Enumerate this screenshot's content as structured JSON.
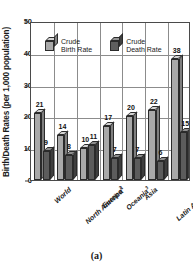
{
  "chart_data": {
    "type": "bar",
    "title": "",
    "xlabel": "",
    "ylabel": "Birth/Death Rates (per 1,000 population)",
    "ylim": [
      0,
      50
    ],
    "yticks": [
      0,
      10,
      20,
      30,
      40,
      50
    ],
    "grid": true,
    "legend_position": "top-left-inside",
    "categories": [
      "World",
      "North America",
      "Europe",
      "Oceania",
      "Asia",
      "Latin America and the Caribbean",
      "Africa"
    ],
    "category_footnotes": [
      "",
      "1",
      "2",
      "3",
      "",
      "",
      ""
    ],
    "series": [
      {
        "name": "Crude Birth Rate",
        "values": [
          21,
          14,
          10,
          17,
          20,
          22,
          38
        ],
        "color": "#a9a9a9"
      },
      {
        "name": "Crude Death Rate",
        "values": [
          9,
          8,
          11,
          7,
          7,
          6,
          15
        ],
        "color": "#5c5c5c"
      }
    ]
  },
  "axis": {
    "y_title": "Birth/Death Rates (per 1,000 population)",
    "y_ticks": [
      "0",
      "10",
      "20",
      "30",
      "40",
      "50"
    ]
  },
  "legend": {
    "items": [
      {
        "label_line1": "Crude",
        "label_line2": "Birth Rate",
        "swatch": "cube-light-icon"
      },
      {
        "label_line1": "Crude",
        "label_line2": "Death Rate",
        "swatch": "cube-dark-icon"
      }
    ]
  },
  "xlabels": [
    {
      "text": "World",
      "note": ""
    },
    {
      "text": "North America",
      "note": "1"
    },
    {
      "text": "Europe",
      "note": "2"
    },
    {
      "text": "Oceania",
      "note": "3"
    },
    {
      "text": "Asia",
      "note": ""
    },
    {
      "text": "Latin America",
      "note": ""
    },
    {
      "text": "and the",
      "note": ""
    },
    {
      "text": "Caribbean",
      "note": ""
    },
    {
      "text": "Africa",
      "note": ""
    }
  ],
  "values": {
    "birth": [
      "21",
      "14",
      "10",
      "17",
      "20",
      "22",
      "38"
    ],
    "death": [
      "9",
      "8",
      "11",
      "7",
      "7",
      "6",
      "15"
    ]
  },
  "caption": "(a)"
}
